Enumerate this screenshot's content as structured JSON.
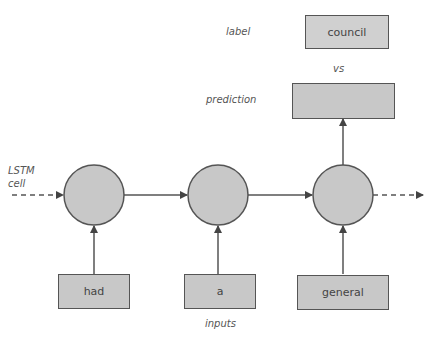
{
  "labels": {
    "label": "label",
    "vs": "vs",
    "prediction": "prediction",
    "lstm_cell_line1": "LSTM",
    "lstm_cell_line2": "cell",
    "inputs": "inputs"
  },
  "target_word": "council",
  "prediction_value": "",
  "input_words": [
    "had",
    "a",
    "general"
  ],
  "colors": {
    "node_fill": "#c8c8c8",
    "stroke": "#555555",
    "text": "#555555"
  }
}
